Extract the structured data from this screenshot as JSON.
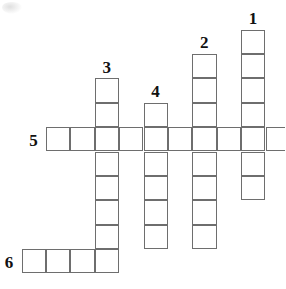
{
  "puzzle": {
    "type": "crossword-grid",
    "title": "",
    "width": 285,
    "height": 289,
    "cell_size": 24.4,
    "grid_origin": {
      "x": 21.5,
      "y": 29.5
    },
    "line_color": "#6e6e6e",
    "number_color": "#111111",
    "background_color": "#ffffff",
    "entries": [
      {
        "number": "1",
        "direction": "down",
        "length": 7,
        "start_col": 9,
        "start_row": 0,
        "label_col": 9,
        "label_row": -1
      },
      {
        "number": "2",
        "direction": "down",
        "length": 8,
        "start_col": 7,
        "start_row": 1,
        "label_col": 7,
        "label_row": 0
      },
      {
        "number": "3",
        "direction": "down",
        "length": 7,
        "start_col": 3,
        "start_row": 2,
        "label_col": 3,
        "label_row": 1
      },
      {
        "number": "4",
        "direction": "down",
        "length": 6,
        "start_col": 5,
        "start_row": 3,
        "label_col": 5,
        "label_row": 2
      },
      {
        "number": "5",
        "direction": "across",
        "length": 10,
        "start_col": 1,
        "start_row": 4,
        "label_col": 0,
        "label_row": 4
      },
      {
        "number": "6",
        "direction": "across",
        "length": 4,
        "start_col": 0,
        "start_row": 9,
        "label_col": -1,
        "label_row": 9
      }
    ],
    "clue_numbers": [
      "1",
      "2",
      "3",
      "4",
      "5",
      "6"
    ]
  }
}
